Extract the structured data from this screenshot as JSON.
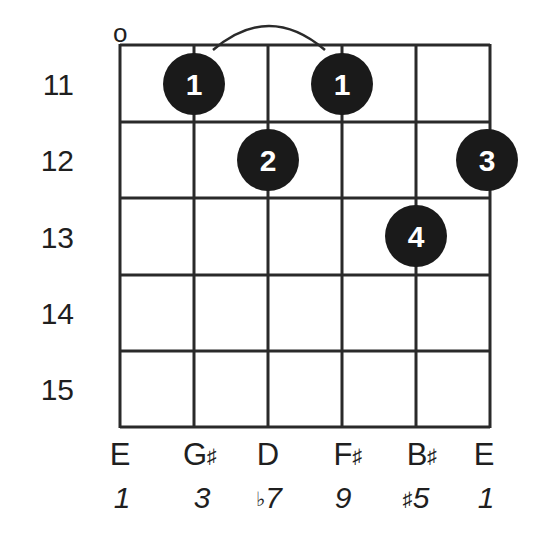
{
  "diagram": {
    "type": "guitar-chord-diagram",
    "open_marker": "o",
    "open_marker_string": 1,
    "fret_numbers": [
      "11",
      "12",
      "13",
      "14",
      "15"
    ],
    "strings": [
      {
        "note": "E",
        "note_accidental": "",
        "interval": "1",
        "interval_prefix": ""
      },
      {
        "note": "G",
        "note_accidental": "♯",
        "interval": "3",
        "interval_prefix": ""
      },
      {
        "note": "D",
        "note_accidental": "",
        "interval": "7",
        "interval_prefix": "♭"
      },
      {
        "note": "F",
        "note_accidental": "♯",
        "interval": "9",
        "interval_prefix": ""
      },
      {
        "note": "B",
        "note_accidental": "♯",
        "interval": "5",
        "interval_prefix": "♯"
      },
      {
        "note": "E",
        "note_accidental": "",
        "interval": "1",
        "interval_prefix": ""
      }
    ],
    "fingers": [
      {
        "string": 2,
        "fret": 11,
        "finger": "1"
      },
      {
        "string": 4,
        "fret": 11,
        "finger": "1"
      },
      {
        "string": 3,
        "fret": 12,
        "finger": "2"
      },
      {
        "string": 6,
        "fret": 12,
        "finger": "3"
      },
      {
        "string": 5,
        "fret": 13,
        "finger": "4"
      }
    ],
    "tie": {
      "from_string": 2,
      "to_string": 4,
      "fret": 11
    },
    "colors": {
      "line": "#2a2a2a",
      "dot": "#1a1a1a",
      "dot_text": "#ffffff",
      "background": "#ffffff"
    }
  }
}
